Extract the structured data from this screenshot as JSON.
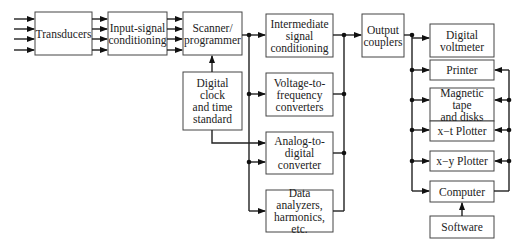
{
  "diagram": {
    "type": "block-diagram",
    "blocks": {
      "transducers": "Transducers",
      "input_conditioning": "Input-signal\nconditioning",
      "scanner": "Scanner/\nprogrammer",
      "clock": "Digital\nclock\nand time\nstandard",
      "intermediate": "Intermediate\nsignal\nconditioning",
      "vtof": "Voltage-to-\nfrequency\nconverters",
      "adc": "Analog-to-\ndigital\nconverter",
      "analyzers": "Data\nanalyzers,\nharmonics, etc.",
      "couplers": "Output\ncouplers",
      "voltmeter": "Digital\nvoltmeter",
      "printer": "Printer",
      "tape": "Magnetic tape\nand disks",
      "xt_plotter": "x−t Plotter",
      "xy_plotter": "x−y Plotter",
      "computer": "Computer",
      "software": "Software"
    },
    "connections": [
      "inputs -> Transducers (4 lines)",
      "Transducers -> Input-signal conditioning (4 lines)",
      "Input-signal conditioning -> Scanner/programmer (4 lines)",
      "Digital clock and time standard -> Scanner/programmer",
      "Digital clock and time standard -> Analog-to-digital converter",
      "Scanner/programmer -> Intermediate signal conditioning",
      "Scanner/programmer -> Voltage-to-frequency converters",
      "Scanner/programmer -> Analog-to-digital converter",
      "Scanner/programmer -> Data analyzers, harmonics, etc.",
      "Intermediate/V-to-F/ADC/Data analyzers -> Output couplers",
      "Output couplers -> Digital voltmeter, Printer, Magnetic tape and disks, x−t Plotter, x−y Plotter, Computer",
      "Computer -> Printer, Magnetic tape and disks, x−t Plotter, x−y Plotter",
      "Software -> Computer"
    ]
  }
}
